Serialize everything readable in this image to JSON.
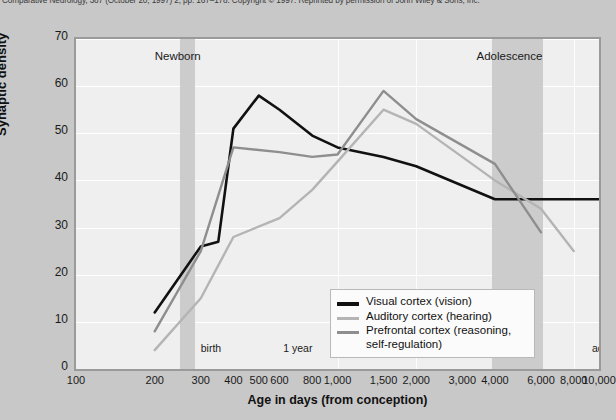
{
  "caption": "Comparative Neurology, 387 (October 20, 1997) 2, pp. 167–178. Copyright © 1997. Reprinted by permission of John Wiley & Sons, Inc.",
  "axes": {
    "ylabel": "Synaptic density",
    "xlabel": "Age in days (from conception)",
    "yticks": [
      0,
      10,
      20,
      30,
      40,
      50,
      60,
      70
    ],
    "xticks": [
      "100",
      "200",
      "300",
      "400",
      "500",
      "600",
      "800",
      "1,000",
      "1,500",
      "2,000",
      "3,000",
      "4,000",
      "6,000",
      "8,000",
      "10,000"
    ]
  },
  "period_labels": [
    {
      "text": "Newborn"
    },
    {
      "text": "Adolescence"
    }
  ],
  "milestones": [
    {
      "text": "birth"
    },
    {
      "text": "1 year"
    },
    {
      "text": "3 years"
    },
    {
      "text": "11 years"
    },
    {
      "text": "adult"
    }
  ],
  "legend": {
    "items": [
      {
        "label": "Visual cortex (vision)",
        "color": "#111111"
      },
      {
        "label": "Auditory cortex (hearing)",
        "color": "#b4b4b4"
      },
      {
        "label": "Prefrontal cortex (reasoning,",
        "label2": "self-regulation)",
        "color": "#8e8e8e"
      }
    ]
  },
  "chart_data": {
    "type": "line",
    "title": "",
    "xlabel": "Age in days (from conception)",
    "ylabel": "Synaptic density",
    "xscale": "log",
    "xlim": [
      100,
      10000
    ],
    "ylim": [
      0,
      70
    ],
    "grid": true,
    "legend_position": "center",
    "xticks": [
      100,
      200,
      300,
      400,
      500,
      600,
      800,
      1000,
      1500,
      2000,
      3000,
      4000,
      6000,
      8000,
      10000
    ],
    "yticks": [
      0,
      10,
      20,
      30,
      40,
      50,
      60,
      70
    ],
    "shaded_bands": [
      {
        "label": "Newborn",
        "x_start": 250,
        "x_end": 285,
        "color": "#c9c9c9"
      },
      {
        "label": "Adolescence",
        "x_start": 3900,
        "x_end": 6100,
        "color": "#c9c9c9"
      }
    ],
    "annotations": [
      {
        "text": "Newborn",
        "x": 200,
        "y": 66
      },
      {
        "text": "Adolescence",
        "x": 3400,
        "y": 66
      },
      {
        "text": "birth",
        "x": 300,
        "y": 4
      },
      {
        "text": "1 year",
        "x": 620,
        "y": 4
      },
      {
        "text": "3 years",
        "x": 1250,
        "y": 4
      },
      {
        "text": "11 years",
        "x": 3900,
        "y": 4
      },
      {
        "text": "adult",
        "x": 9400,
        "y": 4
      }
    ],
    "series": [
      {
        "name": "Visual cortex (vision)",
        "color": "#111111",
        "x": [
          200,
          300,
          350,
          400,
          500,
          600,
          800,
          1000,
          1500,
          2000,
          4000,
          6000,
          10000
        ],
        "y": [
          12,
          26,
          27,
          51,
          58,
          55,
          49.5,
          47,
          45,
          43,
          36,
          36,
          36
        ]
      },
      {
        "name": "Auditory cortex (hearing)",
        "color": "#b4b4b4",
        "x": [
          200,
          300,
          400,
          600,
          800,
          1000,
          1500,
          2000,
          4000,
          6000,
          8000
        ],
        "y": [
          4,
          15,
          28,
          32,
          38,
          44,
          55,
          52,
          40,
          34,
          25
        ]
      },
      {
        "name": "Prefrontal cortex (reasoning, self-regulation)",
        "color": "#8e8e8e",
        "x": [
          200,
          300,
          400,
          600,
          800,
          1000,
          1500,
          2000,
          4000,
          6000
        ],
        "y": [
          8,
          25,
          47,
          46,
          45,
          45.5,
          59,
          53,
          43.5,
          29
        ]
      }
    ]
  }
}
